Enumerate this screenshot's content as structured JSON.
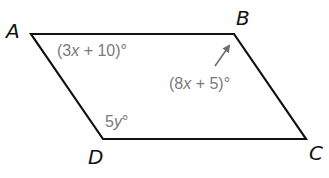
{
  "diagram": {
    "shape": "parallelogram",
    "vertices": [
      {
        "id": "A",
        "label": "A",
        "x": 31,
        "y": 34,
        "label_x": 6,
        "label_y": 38
      },
      {
        "id": "B",
        "label": "B",
        "x": 234,
        "y": 34,
        "label_x": 236,
        "label_y": 25
      },
      {
        "id": "C",
        "label": "C",
        "x": 306,
        "y": 139,
        "label_x": 309,
        "label_y": 160
      },
      {
        "id": "D",
        "label": "D",
        "x": 103,
        "y": 139,
        "label_x": 88,
        "label_y": 164
      }
    ],
    "angles": [
      {
        "vertex": "A",
        "coef": "(3",
        "var": "x",
        "rest": " + 10)°"
      },
      {
        "vertex": "B",
        "coef": "(8",
        "var": "x",
        "rest": " + 5)°"
      },
      {
        "vertex": "D",
        "coef": "5",
        "var": "y",
        "rest": "°"
      }
    ],
    "colors": {
      "edge": "#111111",
      "angle_label": "#7a7a7a",
      "arrow": "#6e6e6e"
    }
  }
}
